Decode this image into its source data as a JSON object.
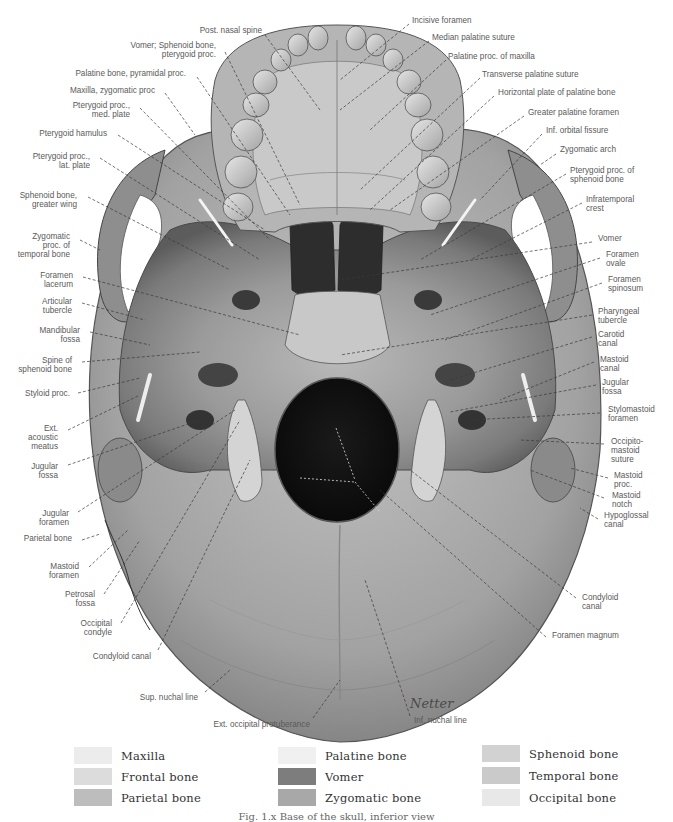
{
  "figure": {
    "caption": "Fig. 1.x  Base of the skull, inferior view",
    "signature": "Netter"
  },
  "labels_left": [
    {
      "text": "Post. nasal spine",
      "x": 262,
      "y": 30,
      "lx1": 265,
      "ly1": 35,
      "lx2": 320,
      "ly2": 110
    },
    {
      "text": "Vomer; Sphenoid bone,\npterygoid proc.",
      "x": 216,
      "y": 45,
      "lx1": 225,
      "ly1": 52,
      "lx2": 300,
      "ly2": 205
    },
    {
      "text": "Palatine bone, pyramidal proc.",
      "x": 186,
      "y": 73,
      "lx1": 197,
      "ly1": 77,
      "lx2": 290,
      "ly2": 215
    },
    {
      "text": "Maxilla, zygomatic proc",
      "x": 155,
      "y": 90,
      "lx1": 165,
      "ly1": 93,
      "lx2": 195,
      "ly2": 135
    },
    {
      "text": "Pterygoid proc.,\nmed. plate",
      "x": 130,
      "y": 105,
      "lx1": 140,
      "ly1": 108,
      "lx2": 270,
      "ly2": 240
    },
    {
      "text": "Pterygoid hamulus",
      "x": 107,
      "y": 133,
      "lx1": 118,
      "ly1": 135,
      "lx2": 265,
      "ly2": 230
    },
    {
      "text": "Pterygoid proc.,\nlat. plate",
      "x": 90,
      "y": 156,
      "lx1": 100,
      "ly1": 158,
      "lx2": 260,
      "ly2": 260
    },
    {
      "text": "Sphenoid bone,\ngreater wing",
      "x": 77,
      "y": 195,
      "lx1": 88,
      "ly1": 197,
      "lx2": 230,
      "ly2": 270
    },
    {
      "text": "Zygomatic\nproc. of\ntemporal bone",
      "x": 70,
      "y": 236,
      "lx1": 80,
      "ly1": 240,
      "lx2": 100,
      "ly2": 250
    },
    {
      "text": "Foramen\nlacerum",
      "x": 73,
      "y": 275,
      "lx1": 83,
      "ly1": 277,
      "lx2": 300,
      "ly2": 335
    },
    {
      "text": "Articular\ntubercle",
      "x": 72,
      "y": 301,
      "lx1": 82,
      "ly1": 303,
      "lx2": 145,
      "ly2": 320
    },
    {
      "text": "Mandibular\nfossa",
      "x": 80,
      "y": 330,
      "lx1": 90,
      "ly1": 332,
      "lx2": 150,
      "ly2": 345
    },
    {
      "text": "Spine of\nsphenoid bone",
      "x": 72,
      "y": 360,
      "lx1": 82,
      "ly1": 362,
      "lx2": 200,
      "ly2": 352
    },
    {
      "text": "Styloid proc.",
      "x": 70,
      "y": 393,
      "lx1": 78,
      "ly1": 393,
      "lx2": 140,
      "ly2": 378
    },
    {
      "text": "Ext.\nacoustic\nmeatus",
      "x": 58,
      "y": 428,
      "lx1": 68,
      "ly1": 430,
      "lx2": 140,
      "ly2": 395
    },
    {
      "text": "Jugular\nfossa",
      "x": 58,
      "y": 466,
      "lx1": 68,
      "ly1": 465,
      "lx2": 200,
      "ly2": 420
    },
    {
      "text": "Jugular\nforamen",
      "x": 69,
      "y": 513,
      "lx1": 78,
      "ly1": 512,
      "lx2": 235,
      "ly2": 410
    },
    {
      "text": "Parietal bone",
      "x": 72,
      "y": 538,
      "lx1": 82,
      "ly1": 540,
      "lx2": 100,
      "ly2": 534
    },
    {
      "text": "Mastoid\nforamen",
      "x": 79,
      "y": 566,
      "lx1": 89,
      "ly1": 567,
      "lx2": 128,
      "ly2": 530
    },
    {
      "text": "Petrosal\nfossa",
      "x": 95,
      "y": 594,
      "lx1": 104,
      "ly1": 594,
      "lx2": 140,
      "ly2": 540
    },
    {
      "text": "Occipital\ncondyle",
      "x": 112,
      "y": 623,
      "lx1": 121,
      "ly1": 623,
      "lx2": 240,
      "ly2": 420
    },
    {
      "text": "Condyloid canal",
      "x": 151,
      "y": 656,
      "lx1": 158,
      "ly1": 650,
      "lx2": 250,
      "ly2": 460
    },
    {
      "text": "Sup. nuchal line",
      "x": 198,
      "y": 697,
      "lx1": 205,
      "ly1": 692,
      "lx2": 230,
      "ly2": 670
    },
    {
      "text": "Ext. occipital protuberance",
      "x": 310,
      "y": 724,
      "lx1": 313,
      "ly1": 718,
      "lx2": 340,
      "ly2": 680
    }
  ],
  "labels_right": [
    {
      "text": "Incisive foramen",
      "x": 412,
      "y": 20,
      "lx1": 409,
      "ly1": 24,
      "lx2": 340,
      "ly2": 80
    },
    {
      "text": "Median palatine suture",
      "x": 432,
      "y": 37,
      "lx1": 429,
      "ly1": 41,
      "lx2": 340,
      "ly2": 110
    },
    {
      "text": "Palatine proc. of maxilla",
      "x": 448,
      "y": 56,
      "lx1": 446,
      "ly1": 60,
      "lx2": 370,
      "ly2": 130
    },
    {
      "text": "Transverse palatine suture",
      "x": 482,
      "y": 74,
      "lx1": 480,
      "ly1": 78,
      "lx2": 360,
      "ly2": 190
    },
    {
      "text": "Horizontal plate of palatine bone",
      "x": 498,
      "y": 92,
      "lx1": 494,
      "ly1": 96,
      "lx2": 370,
      "ly2": 210
    },
    {
      "text": "Greater palatine foramen",
      "x": 528,
      "y": 112,
      "lx1": 524,
      "ly1": 116,
      "lx2": 390,
      "ly2": 210
    },
    {
      "text": "Inf. orbital fissure",
      "x": 546,
      "y": 130,
      "lx1": 542,
      "ly1": 134,
      "lx2": 480,
      "ly2": 200
    },
    {
      "text": "Zygomatic arch",
      "x": 560,
      "y": 149,
      "lx1": 556,
      "ly1": 154,
      "lx2": 540,
      "ly2": 165
    },
    {
      "text": "Pterygoid proc. of\nsphenoid bone",
      "x": 570,
      "y": 170,
      "lx1": 566,
      "ly1": 174,
      "lx2": 420,
      "ly2": 260
    },
    {
      "text": "Infratemporal\ncrest",
      "x": 586,
      "y": 199,
      "lx1": 582,
      "ly1": 203,
      "lx2": 470,
      "ly2": 260
    },
    {
      "text": "Vomer",
      "x": 598,
      "y": 238,
      "lx1": 592,
      "ly1": 242,
      "lx2": 340,
      "ly2": 280
    },
    {
      "text": "Foramen\novale",
      "x": 606,
      "y": 254,
      "lx1": 600,
      "ly1": 258,
      "lx2": 430,
      "ly2": 315
    },
    {
      "text": "Foramen\nspinosum",
      "x": 608,
      "y": 279,
      "lx1": 602,
      "ly1": 283,
      "lx2": 445,
      "ly2": 340
    },
    {
      "text": "Pharyngeal\ntubercle",
      "x": 598,
      "y": 311,
      "lx1": 592,
      "ly1": 315,
      "lx2": 340,
      "ly2": 355
    },
    {
      "text": "Carotid\ncanal",
      "x": 598,
      "y": 334,
      "lx1": 592,
      "ly1": 337,
      "lx2": 450,
      "ly2": 380
    },
    {
      "text": "Mastoid\ncanal",
      "x": 600,
      "y": 359,
      "lx1": 594,
      "ly1": 362,
      "lx2": 500,
      "ly2": 400
    },
    {
      "text": "Jugular\nfossa",
      "x": 602,
      "y": 382,
      "lx1": 596,
      "ly1": 385,
      "lx2": 450,
      "ly2": 412
    },
    {
      "text": "Stylomastoid\nforamen",
      "x": 608,
      "y": 409,
      "lx1": 600,
      "ly1": 413,
      "lx2": 470,
      "ly2": 420
    },
    {
      "text": "Occipito-\nmastoid\nsuture",
      "x": 611,
      "y": 441,
      "lx1": 604,
      "ly1": 444,
      "lx2": 520,
      "ly2": 440
    },
    {
      "text": "Mastoid\nproc.",
      "x": 614,
      "y": 475,
      "lx1": 608,
      "ly1": 478,
      "lx2": 570,
      "ly2": 468
    },
    {
      "text": "Mastoid\nnotch",
      "x": 612,
      "y": 495,
      "lx1": 604,
      "ly1": 498,
      "lx2": 530,
      "ly2": 470
    },
    {
      "text": "Hypoglossal\ncanal",
      "x": 604,
      "y": 515,
      "lx1": 598,
      "ly1": 519,
      "lx2": 580,
      "ly2": 508
    },
    {
      "text": "Condyloid\ncanal",
      "x": 582,
      "y": 597,
      "lx1": 576,
      "ly1": 598,
      "lx2": 410,
      "ly2": 470
    },
    {
      "text": "Foramen magnum",
      "x": 552,
      "y": 635,
      "lx1": 546,
      "ly1": 637,
      "lx2": 380,
      "ly2": 490
    },
    {
      "text": "Inf. nuchal line",
      "x": 414,
      "y": 720,
      "lx1": 410,
      "ly1": 716,
      "lx2": 365,
      "ly2": 580
    }
  ],
  "legend": [
    {
      "label": "Maxilla",
      "color": "#ececec",
      "x": 74,
      "y": 746
    },
    {
      "label": "Frontal bone",
      "color": "#dcdcdc",
      "x": 74,
      "y": 767
    },
    {
      "label": "Parietal bone",
      "color": "#bdbdbd",
      "x": 74,
      "y": 788
    },
    {
      "label": "Palatine bone",
      "color": "#f0f0f0",
      "x": 278,
      "y": 746
    },
    {
      "label": "Vomer",
      "color": "#7d7d7d",
      "x": 278,
      "y": 767
    },
    {
      "label": "Zygomatic bone",
      "color": "#a8a8a8",
      "x": 278,
      "y": 788
    },
    {
      "label": "Sphenoid bone",
      "color": "#d2d2d2",
      "x": 482,
      "y": 744
    },
    {
      "label": "Temporal bone",
      "color": "#cacaca",
      "x": 482,
      "y": 766
    },
    {
      "label": "Occipital bone",
      "color": "#e8e8e8",
      "x": 482,
      "y": 788
    }
  ]
}
